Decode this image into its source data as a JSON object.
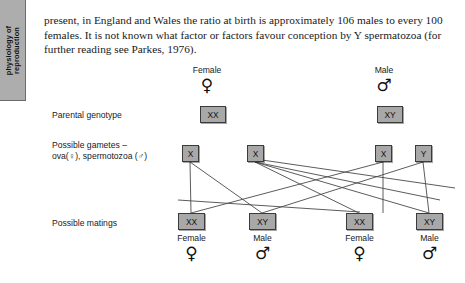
{
  "side_tab": {
    "label": "physiology of\nreproduction",
    "bg_color": "#adadad"
  },
  "body_text": {
    "paragraph": "present, in England and Wales the ratio at birth is approximately 106 males to every 100 females. It is not known what factor or factors favour conception by Y spermatozoa (for further reading see Parkes, 1976)."
  },
  "diagram": {
    "row_labels": {
      "parental": "Parental genotype",
      "gametes": "Possible gametes –\nova(♀), spermotozoa (♂)",
      "matings": "Possible matings"
    },
    "parents": [
      {
        "caption": "Female",
        "symbol": "♀",
        "genotype": "XX"
      },
      {
        "caption": "Male",
        "symbol": "♂",
        "genotype": "XY"
      }
    ],
    "gametes": [
      {
        "allele": "X"
      },
      {
        "allele": "X"
      },
      {
        "allele": "X"
      },
      {
        "allele": "Y"
      }
    ],
    "matings": [
      {
        "genotype": "XX",
        "caption": "Female",
        "symbol": "♀"
      },
      {
        "genotype": "XY",
        "caption": "Male",
        "symbol": "♂"
      },
      {
        "genotype": "XX",
        "caption": "Female",
        "symbol": "♀"
      },
      {
        "genotype": "XY",
        "caption": "Male",
        "symbol": "♂"
      }
    ],
    "box_fill": "#a8a8a8",
    "box_border": "#3b3b3b",
    "line_color": "#4a4a4a"
  }
}
